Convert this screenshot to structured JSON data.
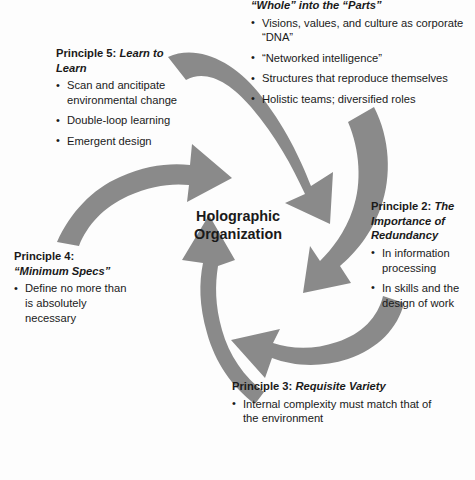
{
  "diagram": {
    "center": {
      "line1": "Holographic",
      "line2": "Organization"
    },
    "arrow_color": "#8a8a8a",
    "principles": [
      {
        "id": "principle-1",
        "heading_plain": "",
        "heading_italic": "“Whole” into the “Parts”",
        "bullets": [
          "Visions, values, and culture as corporate “DNA”",
          "“Networked intelligence”",
          "Structures that reproduce themselves",
          "Holistic teams; diversified roles"
        ]
      },
      {
        "id": "principle-5",
        "heading_plain": "Principle 5: ",
        "heading_italic": "Learn to Learn",
        "bullets": [
          "Scan and ancitipate environmental change",
          "Double-loop learning",
          "Emergent design"
        ]
      },
      {
        "id": "principle-2",
        "heading_plain": "Principle 2: ",
        "heading_italic": "The Importance of Redundancy",
        "bullets": [
          "In information processing",
          "In skills and the design of work"
        ]
      },
      {
        "id": "principle-4",
        "heading_plain": "Principle 4:",
        "heading_italic": "“Minimum Specs”",
        "bullets": [
          "Define no more than is absolutely necessary"
        ]
      },
      {
        "id": "principle-3",
        "heading_plain": "Principle 3: ",
        "heading_italic": "Requisite Variety",
        "bullets": [
          "Internal complexity must match that of the environment"
        ]
      }
    ]
  }
}
